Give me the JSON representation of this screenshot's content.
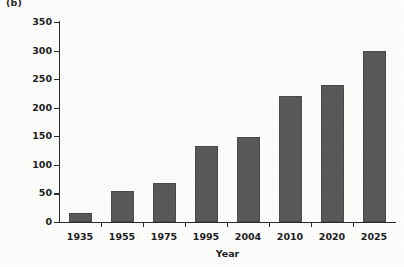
{
  "figure": {
    "panel_label": "(b)",
    "background_color": "#fdfdfc",
    "axis_color": "#2b2b2b"
  },
  "chart_data": {
    "type": "bar",
    "title": "",
    "subtitle": "",
    "panel": "(b)",
    "xlabel": "Year",
    "ylabel": "People with diabetes (millions)",
    "categories": [
      "1935",
      "1955",
      "1975",
      "1995",
      "2004",
      "2010",
      "2020",
      "2025"
    ],
    "values": [
      16,
      55,
      69,
      133,
      149,
      220,
      239,
      299
    ],
    "series": [
      {
        "name": "People with diabetes (millions)",
        "values": [
          16,
          55,
          69,
          133,
          149,
          220,
          239,
          299
        ],
        "color": "#595959"
      }
    ],
    "ylim": [
      0,
      350
    ],
    "ytick_values": [
      0,
      50,
      100,
      150,
      200,
      250,
      300,
      350
    ],
    "ytick_labels": [
      "0",
      "50",
      "100",
      "150",
      "200",
      "250",
      "300",
      "350"
    ],
    "xtick_labels": [
      "1935",
      "1955",
      "1975",
      "1995",
      "2004",
      "2010",
      "2020",
      "2025"
    ],
    "grid": false,
    "legend": false,
    "legend_position": "none",
    "bar_color": "#595959",
    "annotations": []
  }
}
